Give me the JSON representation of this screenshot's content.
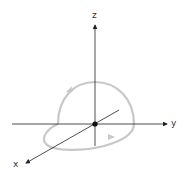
{
  "diagram": {
    "type": "3d-coordinate-axes-with-closed-loop",
    "axes": {
      "z": {
        "label": "z"
      },
      "y": {
        "label": "y"
      },
      "x": {
        "label": "x"
      }
    },
    "origin_marker": "filled-dot",
    "loop": {
      "description": "closed curve with upper semicircular arc in the y-z plane and lower arc in the x-y plane",
      "color": "#c8c8c8",
      "direction_arrows": 2
    },
    "colors": {
      "axis": "#222222",
      "loop": "#c8c8c8",
      "background": "#ffffff"
    }
  }
}
